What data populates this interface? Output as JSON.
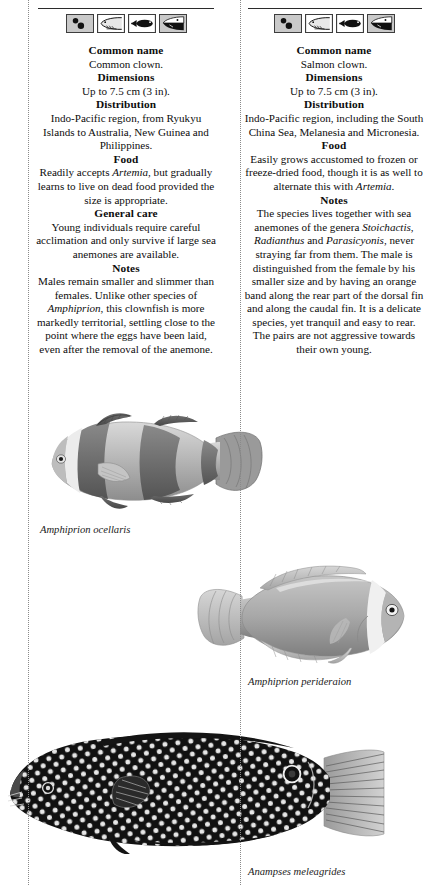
{
  "page": {
    "background_color": "#ffffff",
    "text_color": "#0d0d0d",
    "rule_color": "#2b2b2b",
    "guide_color": "#8a8a8a"
  },
  "columns": [
    {
      "id": "common-clown",
      "icons": [
        {
          "name": "eggs-icon",
          "label": "eggs"
        },
        {
          "name": "fish-head-outline-icon",
          "label": "fish head outline"
        },
        {
          "name": "fish-silhouette-icon",
          "label": "fish silhouette"
        },
        {
          "name": "fish-head-dark-icon",
          "label": "dark fish head"
        }
      ],
      "sections": [
        {
          "heading": "Common name",
          "text": "Common clown."
        },
        {
          "heading": "Dimensions",
          "text": "Up to 7.5 cm (3 in)."
        },
        {
          "heading": "Distribution",
          "text": "Indo-Pacific region, from Ryukyu Islands to Australia, New Guinea and Philippines."
        },
        {
          "heading": "Food",
          "text_html": "Readily accepts <i>Artemia</i>, but gradually learns to live on dead food provided the size is appropriate."
        },
        {
          "heading": "General care",
          "text": "Young individuals require careful acclimation and only survive if large sea anemones are available."
        },
        {
          "heading": "Notes",
          "text_html": "Males remain smaller and slimmer than females. Unlike other species of <i>Amphiprion</i>, this clownfish is more markedly territorial, settling close to the point where the eggs have been laid, even after the removal of the anemone."
        }
      ]
    },
    {
      "id": "salmon-clown",
      "icons": [
        {
          "name": "eggs-icon",
          "label": "eggs"
        },
        {
          "name": "fish-head-outline-icon",
          "label": "fish head outline"
        },
        {
          "name": "fish-silhouette-icon",
          "label": "fish silhouette"
        },
        {
          "name": "fish-head-dark-icon",
          "label": "dark fish head"
        }
      ],
      "sections": [
        {
          "heading": "Common name",
          "text": "Salmon clown."
        },
        {
          "heading": "Dimensions",
          "text": "Up to 7.5 cm (3 in)."
        },
        {
          "heading": "Distribution",
          "text": "Indo-Pacific region, including the South China Sea, Melanesia and Micronesia."
        },
        {
          "heading": "Food",
          "text_html": "Easily grows accustomed to frozen or freeze-dried food, though it is as well to alternate this with <i>Artemia</i>."
        },
        {
          "heading": "Notes",
          "text_html": "The species lives together with sea anemones of the genera <i>Stoichactis</i>, <i>Radianthus</i> and <i>Parasicyonis</i>, never straying far from them. The male is distinguished from the female by his smaller size and by having an orange band along the rear part of the dorsal fin and along the caudal fin. It is a delicate species, yet tranquil and easy to rear. The pairs are not aggressive towards their own young."
        }
      ]
    }
  ],
  "figures": [
    {
      "id": "clown",
      "caption": "Amphiprion ocellaris",
      "subject": "common clownfish photograph, facing left"
    },
    {
      "id": "perideraion",
      "caption": "Amphiprion perideraion",
      "subject": "salmon clownfish photograph, facing right"
    },
    {
      "id": "anampses",
      "caption": "Anampses meleagrides",
      "subject": "spotted wrasse photograph, facing left"
    }
  ]
}
